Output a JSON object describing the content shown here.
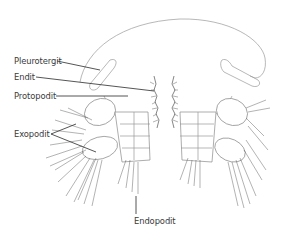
{
  "figure": {
    "labels": [
      {
        "id": "pleurotergit",
        "text": "Pleurotergit"
      },
      {
        "id": "endit",
        "text": "Endit"
      },
      {
        "id": "protopodit",
        "text": "Protopodit"
      },
      {
        "id": "exopodit",
        "text": "Exopodit"
      },
      {
        "id": "endopodit",
        "text": "Endopodit"
      }
    ],
    "colors": {
      "line": "#2a2a2a",
      "drawing": "#8a8a8a",
      "text": "#3a3a3a",
      "background": "#ffffff"
    }
  }
}
